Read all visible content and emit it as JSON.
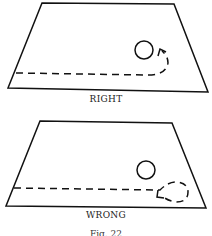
{
  "panels": [
    {
      "id": "right",
      "label": "RIGHT"
    },
    {
      "id": "wrong",
      "label": "WRONG"
    }
  ],
  "caption": "Fig. 22",
  "colors": {
    "stroke": "#111111",
    "background": "#ffffff"
  }
}
